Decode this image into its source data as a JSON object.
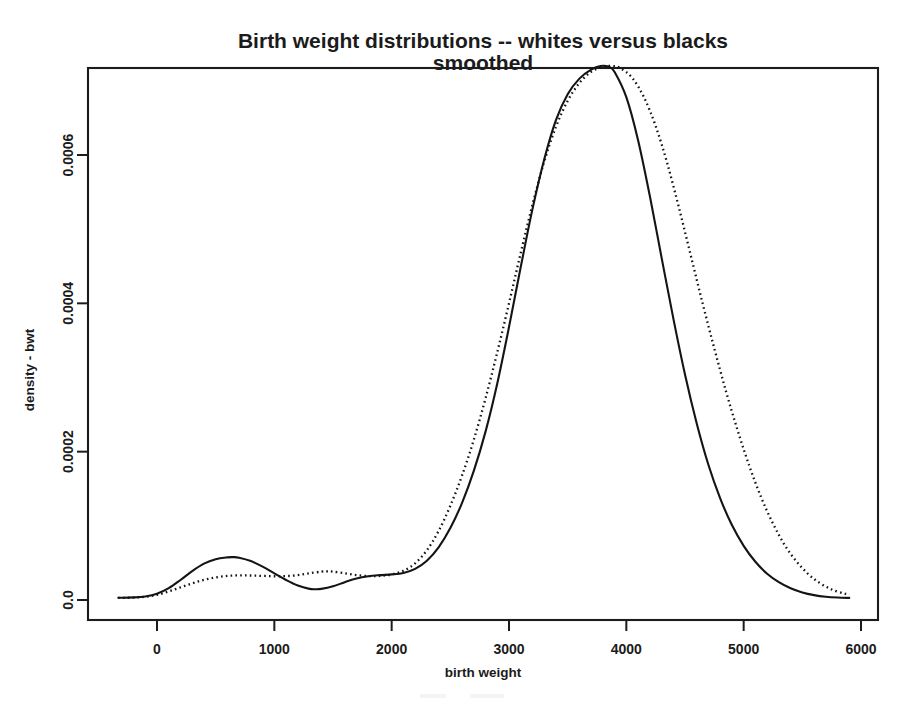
{
  "chart_data": {
    "type": "line",
    "title": "Birth weight distributions -- whites versus blacks",
    "subtitle": "smoothed",
    "xlabel": "birth weight",
    "ylabel": "density - bwt",
    "xlim": [
      -330,
      5900
    ],
    "ylim": [
      0,
      0.000735
    ],
    "grid": false,
    "legend": "none",
    "xticks": [
      0,
      1000,
      2000,
      3000,
      4000,
      5000,
      6000
    ],
    "xtick_labels": [
      "0",
      "1000",
      "2000",
      "3000",
      "4000",
      "5000",
      "6000"
    ],
    "yticks": [
      0.0,
      0.0002,
      0.0004,
      0.0006
    ],
    "ytick_labels": [
      "0.0",
      "0.0002",
      "0.0004",
      "0.0006"
    ],
    "series": [
      {
        "name": "whites",
        "style": "solid",
        "color": "#141414",
        "x": [
          -330,
          -200,
          -100,
          0,
          100,
          200,
          300,
          400,
          500,
          600,
          650,
          700,
          800,
          900,
          1000,
          1100,
          1200,
          1300,
          1350,
          1400,
          1500,
          1600,
          1700,
          1800,
          1900,
          2000,
          2100,
          2200,
          2300,
          2400,
          2500,
          2600,
          2700,
          2800,
          2900,
          3000,
          3100,
          3200,
          3300,
          3400,
          3500,
          3600,
          3700,
          3780,
          3850,
          3900,
          4000,
          4100,
          4200,
          4300,
          4400,
          4500,
          4600,
          4700,
          4800,
          4900,
          5000,
          5100,
          5200,
          5300,
          5400,
          5500,
          5600,
          5700,
          5800,
          5900
        ],
        "y": [
          3e-06,
          3.5e-06,
          4.8e-06,
          8.5e-06,
          1.6e-05,
          2.7e-05,
          3.9e-05,
          4.9e-05,
          5.5e-05,
          5.75e-05,
          5.78e-05,
          5.7e-05,
          5.25e-05,
          4.5e-05,
          3.6e-05,
          2.7e-05,
          1.95e-05,
          1.5e-05,
          1.45e-05,
          1.5e-05,
          1.85e-05,
          2.4e-05,
          2.9e-05,
          3.2e-05,
          3.35e-05,
          3.45e-05,
          3.65e-05,
          4.2e-05,
          5.3e-05,
          7.1e-05,
          9.7e-05,
          0.000131,
          0.000174,
          0.000227,
          0.000292,
          0.000368,
          0.000449,
          0.000527,
          0.000594,
          0.000647,
          0.000682,
          0.000703,
          0.000715,
          0.00072,
          0.000719,
          0.000712,
          0.000678,
          0.00062,
          0.000545,
          0.000462,
          0.00038,
          0.000304,
          0.000238,
          0.000182,
          0.000137,
          0.000101,
          7.3e-05,
          5.15e-05,
          3.55e-05,
          2.4e-05,
          1.58e-05,
          1.02e-05,
          6.6e-06,
          4.4e-06,
          3.3e-06,
          2.8e-06
        ]
      },
      {
        "name": "blacks",
        "style": "dotted",
        "color": "#141414",
        "x": [
          -330,
          -200,
          -100,
          0,
          100,
          200,
          300,
          400,
          500,
          600,
          700,
          800,
          900,
          1000,
          1100,
          1200,
          1300,
          1400,
          1450,
          1500,
          1600,
          1700,
          1800,
          1900,
          2000,
          2100,
          2200,
          2300,
          2400,
          2500,
          2600,
          2700,
          2800,
          2900,
          3000,
          3100,
          3200,
          3300,
          3400,
          3500,
          3600,
          3700,
          3800,
          3880,
          3950,
          4050,
          4150,
          4250,
          4350,
          4450,
          4550,
          4650,
          4750,
          4850,
          4950,
          5050,
          5150,
          5250,
          5350,
          5450,
          5550,
          5650,
          5750,
          5850,
          5900
        ],
        "y": [
          2.8e-06,
          3.3e-06,
          4.4e-06,
          7e-06,
          1.15e-05,
          1.7e-05,
          2.25e-05,
          2.72e-05,
          3.05e-05,
          3.25e-05,
          3.32e-05,
          3.3e-05,
          3.25e-05,
          3.2e-05,
          3.22e-05,
          3.35e-05,
          3.6e-05,
          3.82e-05,
          3.86e-05,
          3.82e-05,
          3.6e-05,
          3.36e-05,
          3.22e-05,
          3.25e-05,
          3.45e-05,
          3.95e-05,
          4.95e-05,
          6.7e-05,
          9.3e-05,
          0.000127,
          0.000168,
          0.000216,
          0.000272,
          0.000334,
          0.0004,
          0.000468,
          0.000533,
          0.000591,
          0.000638,
          0.000673,
          0.000697,
          0.000712,
          0.000719,
          0.00072,
          0.000717,
          0.000704,
          0.000678,
          0.000639,
          0.000588,
          0.000528,
          0.000464,
          0.0004,
          0.000339,
          0.000281,
          0.000228,
          0.00018,
          0.000138,
          0.000103,
          7.4e-05,
          5.2e-05,
          3.5e-05,
          2.28e-05,
          1.42e-05,
          9e-06,
          7.5e-06
        ]
      }
    ]
  },
  "figure": {
    "caption_faint": ""
  }
}
